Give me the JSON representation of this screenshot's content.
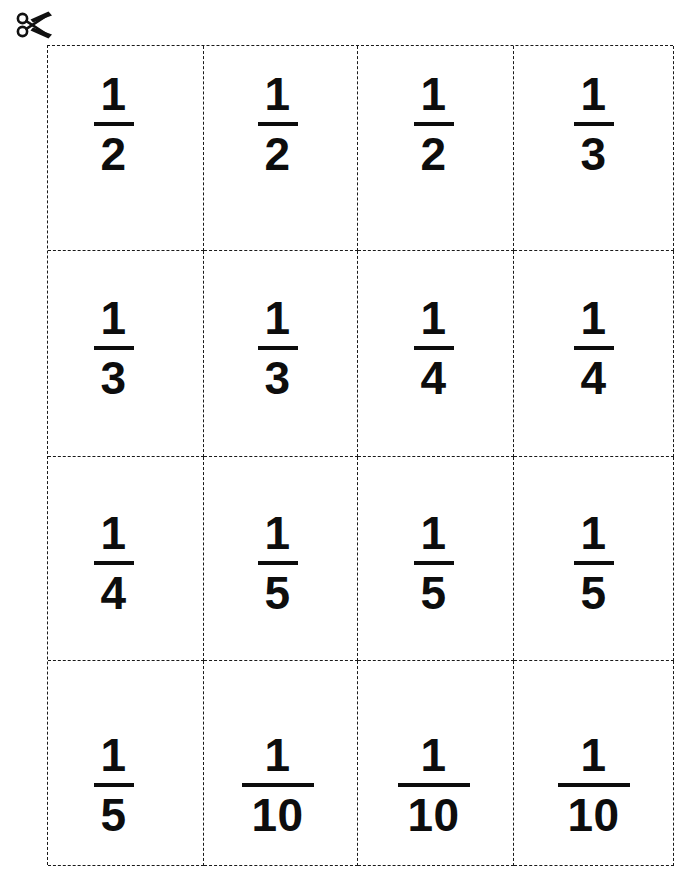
{
  "page": {
    "background_color": "#ffffff",
    "ink_color": "#0d0d0d",
    "grid_line_color": "#1a1a1a",
    "grid_line_style": "dashed",
    "rows": 4,
    "columns": 4
  },
  "cut_marker": {
    "icon": "scissors-icon",
    "label": "cut along dashed lines"
  },
  "cards": [
    {
      "numerator": "1",
      "denominator": "2",
      "wide": false
    },
    {
      "numerator": "1",
      "denominator": "2",
      "wide": false
    },
    {
      "numerator": "1",
      "denominator": "2",
      "wide": false
    },
    {
      "numerator": "1",
      "denominator": "3",
      "wide": false
    },
    {
      "numerator": "1",
      "denominator": "3",
      "wide": false
    },
    {
      "numerator": "1",
      "denominator": "3",
      "wide": false
    },
    {
      "numerator": "1",
      "denominator": "4",
      "wide": false
    },
    {
      "numerator": "1",
      "denominator": "4",
      "wide": false
    },
    {
      "numerator": "1",
      "denominator": "4",
      "wide": false
    },
    {
      "numerator": "1",
      "denominator": "5",
      "wide": false
    },
    {
      "numerator": "1",
      "denominator": "5",
      "wide": false
    },
    {
      "numerator": "1",
      "denominator": "5",
      "wide": false
    },
    {
      "numerator": "1",
      "denominator": "5",
      "wide": false
    },
    {
      "numerator": "1",
      "denominator": "10",
      "wide": true
    },
    {
      "numerator": "1",
      "denominator": "10",
      "wide": true
    },
    {
      "numerator": "1",
      "denominator": "10",
      "wide": true
    }
  ]
}
